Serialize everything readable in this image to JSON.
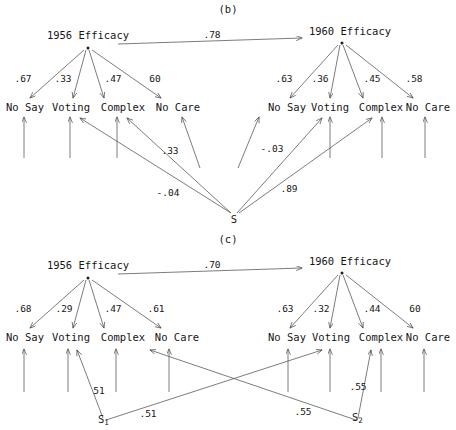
{
  "figure": {
    "type": "path-diagram"
  },
  "panels": [
    {
      "id": "b",
      "title": "(b)",
      "latents": [
        {
          "id": "eff1956",
          "label": "1956 Efficacy"
        },
        {
          "id": "eff1960",
          "label": "1960 Efficacy"
        }
      ],
      "stability_path": {
        "from": "eff1956",
        "to": "eff1960",
        "coefficient": ".78"
      },
      "indicators_left": [
        {
          "label": "No Say",
          "coefficient": ".67"
        },
        {
          "label": "Voting",
          "coefficient": ".33"
        },
        {
          "label": "Complex",
          "coefficient": ".47"
        },
        {
          "label": "No Care",
          "coefficient": "60"
        }
      ],
      "indicators_right": [
        {
          "label": "No Say",
          "coefficient": ".63"
        },
        {
          "label": "Voting",
          "coefficient": ".36"
        },
        {
          "label": "Complex",
          "coefficient": ".45"
        },
        {
          "label": "No Care",
          "coefficient": ".58"
        }
      ],
      "response_factors": [
        {
          "id": "s",
          "label": "S",
          "paths": [
            {
              "target": "left-voting",
              "coefficient": "-.04"
            },
            {
              "target": "left-complex",
              "coefficient": ".33"
            },
            {
              "target": "right-voting",
              "coefficient": "-.03"
            },
            {
              "target": "right-complex",
              "coefficient": ".89"
            }
          ]
        }
      ]
    },
    {
      "id": "c",
      "title": "(c)",
      "latents": [
        {
          "id": "eff1956",
          "label": "1956 Efficacy"
        },
        {
          "id": "eff1960",
          "label": "1960 Efficacy"
        }
      ],
      "stability_path": {
        "from": "eff1956",
        "to": "eff1960",
        "coefficient": ".70"
      },
      "indicators_left": [
        {
          "label": "No Say",
          "coefficient": ".68"
        },
        {
          "label": "Voting",
          "coefficient": ".29"
        },
        {
          "label": "Complex",
          "coefficient": ".47"
        },
        {
          "label": "No Care",
          "coefficient": ".61"
        }
      ],
      "indicators_right": [
        {
          "label": "No Say",
          "coefficient": ".63"
        },
        {
          "label": "Voting",
          "coefficient": ".32"
        },
        {
          "label": "Complex",
          "coefficient": ".44"
        },
        {
          "label": "No Care",
          "coefficient": "60"
        }
      ],
      "response_factors": [
        {
          "id": "s1",
          "label": "S",
          "subscript": "1",
          "paths": [
            {
              "target": "left-voting",
              "coefficient": "51"
            },
            {
              "target": "right-voting",
              "coefficient": ".51"
            }
          ]
        },
        {
          "id": "s2",
          "label": "S",
          "subscript": "2",
          "paths": [
            {
              "target": "left-complex",
              "coefficient": ".55"
            },
            {
              "target": "right-complex",
              "coefficient": ".55"
            }
          ]
        }
      ]
    }
  ],
  "colors": {
    "ink": "#161616",
    "line": "#555555",
    "background": "#ffffff"
  }
}
